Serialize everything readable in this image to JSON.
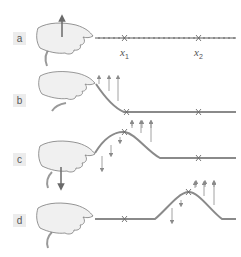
{
  "diagram": {
    "panels": [
      {
        "label": "a",
        "hand_motion": "up"
      },
      {
        "label": "b",
        "hand_motion": "up (rope lifted)"
      },
      {
        "label": "c",
        "hand_motion": "down"
      },
      {
        "label": "d",
        "hand_motion": "rest (pulse traveled right)"
      }
    ],
    "position_labels": [
      {
        "var": "x",
        "sub": "1"
      },
      {
        "var": "x",
        "sub": "2"
      }
    ],
    "colors": {
      "rope": "#8a8a8a",
      "hand_fill": "#f0f0f0",
      "hand_stroke": "#7a7a7a",
      "arrow": "#8a8a8a",
      "hand_arrow": "#6a6a6a",
      "label_bg": "#ececec"
    }
  }
}
